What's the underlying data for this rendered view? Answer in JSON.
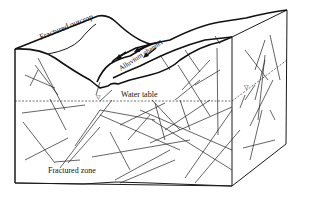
{
  "diagram": {
    "type": "block-diagram",
    "labels": {
      "fractured_outcrop": "Fractured outcrop",
      "alluvium_channel": "Alluvium channel",
      "water_table": "Water table",
      "fractured_zone": "Fractured zone",
      "water_table_symbol_left": "▽",
      "water_table_symbol_right": "▽"
    },
    "colors": {
      "line": "#111111",
      "background": "#ffffff"
    }
  }
}
